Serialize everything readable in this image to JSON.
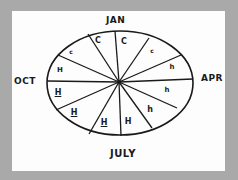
{
  "diagram": {
    "type": "hand-drawn seasonal calendar wheel",
    "month_labels": {
      "top": "JAN",
      "right": "APR",
      "bottom": "JULY",
      "left": "OCT"
    },
    "segments": [
      {
        "label": "C",
        "size": "large",
        "underlined": false
      },
      {
        "label": "c",
        "size": "small",
        "underlined": false
      },
      {
        "label": "h",
        "size": "small",
        "underlined": false
      },
      {
        "label": "h",
        "size": "small",
        "underlined": false
      },
      {
        "label": "h",
        "size": "small",
        "underlined": false
      },
      {
        "label": "H",
        "size": "large",
        "underlined": false
      },
      {
        "label": "H",
        "size": "large",
        "underlined": true
      },
      {
        "label": "H",
        "size": "large",
        "underlined": true
      },
      {
        "label": "H",
        "size": "large",
        "underlined": true
      },
      {
        "label": "H",
        "size": "large",
        "underlined": false
      },
      {
        "label": "c",
        "size": "small",
        "underlined": false
      },
      {
        "label": "C",
        "size": "large",
        "underlined": false
      }
    ],
    "colors": {
      "ink": "#1a1a1a",
      "paper": "#fdfdfd",
      "background": "#a9a9a9"
    }
  }
}
